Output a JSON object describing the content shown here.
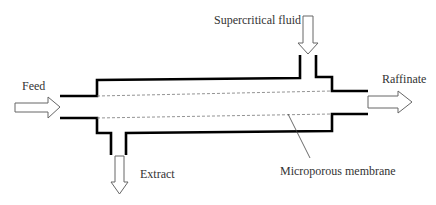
{
  "diagram": {
    "type": "supercritical membrane extraction module schematic",
    "labels": {
      "feed": "Feed",
      "supercritical_fluid": "Supercritical fluid",
      "raffinate": "Raffinate",
      "extract": "Extract",
      "membrane": "Microporous membrane"
    },
    "colors": {
      "wall": "#000000",
      "membrane": "#777777",
      "arrow_stroke": "#666666",
      "text": "#333333",
      "background": "#ffffff"
    }
  }
}
